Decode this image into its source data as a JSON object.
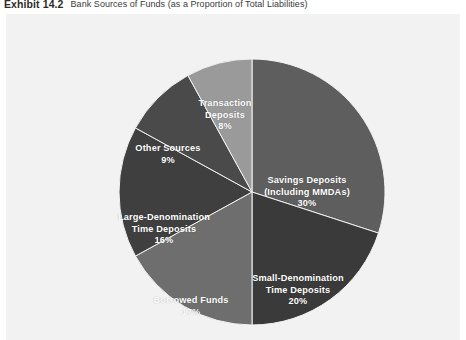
{
  "header": {
    "exhibit_label": "Exhibit 14.2",
    "title": "Bank Sources of Funds (as a Proportion of Total Liabilities)"
  },
  "panel": {
    "background_color": "#f2f2f2"
  },
  "chart_data": {
    "type": "pie",
    "title": "Bank Sources of Funds (as a Proportion of Total Liabilities)",
    "xlabel": "",
    "ylabel": "",
    "legend_position": "none",
    "grid": false,
    "value_unit": "percent",
    "total": 100,
    "start_angle_deg": 0,
    "direction": "clockwise",
    "categories": [
      "Savings Deposits (Including MMDAs)",
      "Small-Denomination Time Deposits",
      "Borrowed Funds",
      "Large-Denomination Time Deposits",
      "Other Sources",
      "Transaction Deposits"
    ],
    "values": [
      30,
      20,
      17,
      16,
      9,
      8
    ],
    "colors": [
      "#5e5e5e",
      "#3a3a3a",
      "#6e6e6e",
      "#3f3f3f",
      "#4a4a4a",
      "#9a9a9a"
    ],
    "slices": [
      {
        "name": "savings-deposits",
        "line1": "Savings Deposits",
        "line2": "(Including MMDAs)",
        "percent_label": "30%",
        "value": 30,
        "color": "#5e5e5e"
      },
      {
        "name": "small-denomination-time-deposits",
        "line1": "Small-Denomination",
        "line2": "Time Deposits",
        "percent_label": "20%",
        "value": 20,
        "color": "#3a3a3a"
      },
      {
        "name": "borrowed-funds",
        "line1": "Borrowed Funds",
        "line2": "",
        "percent_label": "17%",
        "value": 17,
        "color": "#6e6e6e"
      },
      {
        "name": "large-denomination-time-deposits",
        "line1": "Large-Denomination",
        "line2": "Time Deposits",
        "percent_label": "16%",
        "value": 16,
        "color": "#3f3f3f"
      },
      {
        "name": "other-sources",
        "line1": "Other Sources",
        "line2": "",
        "percent_label": "9%",
        "value": 9,
        "color": "#4a4a4a"
      },
      {
        "name": "transaction-deposits",
        "line1": "Transaction",
        "line2": "Deposits",
        "percent_label": "8%",
        "value": 8,
        "color": "#9a9a9a"
      }
    ]
  }
}
